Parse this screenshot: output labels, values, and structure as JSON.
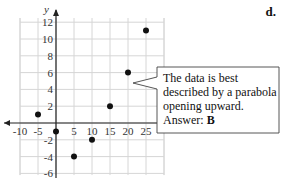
{
  "problem_label": "d.",
  "callout": {
    "lines": [
      "The data is best",
      "described by a parabola",
      "opening upward."
    ],
    "answer_prefix": "Answer:",
    "answer_value": "B"
  },
  "chart_data": {
    "type": "scatter",
    "title": "",
    "xlabel": "",
    "ylabel": "y",
    "x_ticks": [
      -10,
      -5,
      5,
      10,
      15,
      20,
      25
    ],
    "y_ticks": [
      12,
      10,
      8,
      6,
      4,
      2,
      -2,
      -4,
      -6
    ],
    "xlim": [
      -11,
      27.5
    ],
    "ylim": [
      -6.5,
      13
    ],
    "grid": true,
    "points": [
      {
        "x": -5,
        "y": 1
      },
      {
        "x": 0,
        "y": -1
      },
      {
        "x": 5,
        "y": -4
      },
      {
        "x": 10,
        "y": -2
      },
      {
        "x": 15,
        "y": 2
      },
      {
        "x": 20,
        "y": 6
      },
      {
        "x": 25,
        "y": 11
      }
    ],
    "annotation": "The data is best described by a parabola opening upward. Answer: B"
  }
}
